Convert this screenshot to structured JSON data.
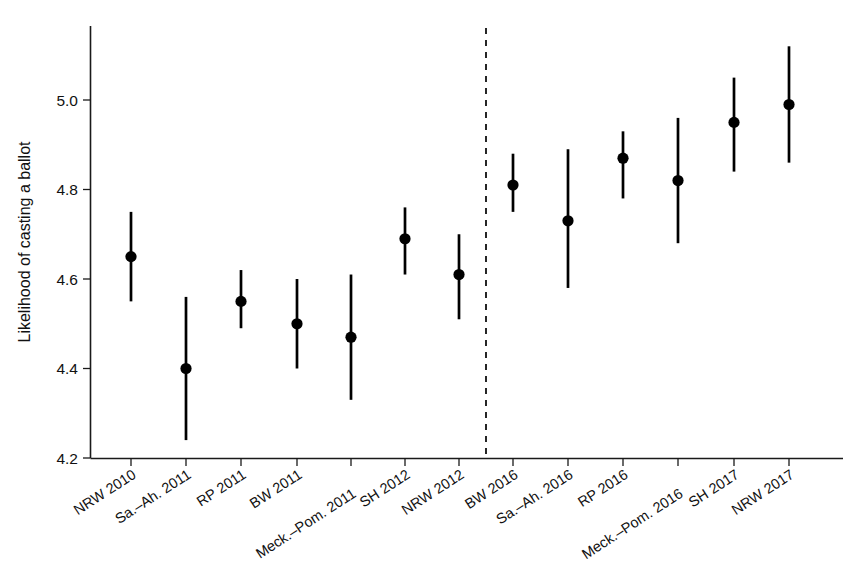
{
  "chart_data": {
    "type": "scatter",
    "title": "",
    "subtitle": "",
    "xlabel": "",
    "ylabel": "Likelihood of casting a ballot",
    "ylim": [
      4.18,
      5.14
    ],
    "yticks": [
      4.2,
      4.4,
      4.6,
      4.8,
      5.0
    ],
    "ytick_labels": [
      "4.2",
      "4.4",
      "4.6",
      "4.8",
      "5.0"
    ],
    "grid": false,
    "legend": "none",
    "categories": [
      "NRW 2010",
      "Sa.–Ah. 2011",
      "RP 2011",
      "BW 2011",
      "Meck.–Pom. 2011",
      "SH 2012",
      "NRW 2012",
      "BW 2016",
      "Sa.–Ah. 2016",
      "RP 2016",
      "Meck.–Pom. 2016",
      "SH 2017",
      "NRW 2017"
    ],
    "values": [
      4.65,
      4.4,
      4.55,
      4.5,
      4.47,
      4.69,
      4.61,
      4.81,
      4.73,
      4.87,
      4.82,
      4.95,
      4.99
    ],
    "ci_low": [
      4.55,
      4.24,
      4.49,
      4.4,
      4.33,
      4.61,
      4.51,
      4.75,
      4.58,
      4.78,
      4.68,
      4.84,
      4.86
    ],
    "ci_high": [
      4.75,
      4.56,
      4.62,
      4.6,
      4.61,
      4.76,
      4.7,
      4.88,
      4.89,
      4.93,
      4.96,
      5.05,
      5.12
    ],
    "annotations": [
      {
        "name": "period-divider",
        "type": "vertical-dashed-line",
        "between_categories": [
          "NRW 2012",
          "BW 2016"
        ],
        "style": "dashed"
      }
    ],
    "colors": {
      "marker": "#000000",
      "errorbar": "#000000",
      "axis": "#1a1a1a",
      "divider": "#000000",
      "background": "#ffffff"
    }
  }
}
